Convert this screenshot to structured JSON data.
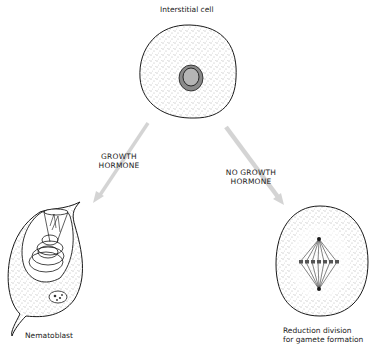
{
  "diagram": {
    "top_node": {
      "label": "Interstitial cell"
    },
    "left_branch": {
      "arrow_label_line1": "GROWTH",
      "arrow_label_line2": "HORMONE"
    },
    "right_branch": {
      "arrow_label_line1": "NO GROWTH",
      "arrow_label_line2": "HORMONE"
    },
    "left_node": {
      "label": "Nematoblast"
    },
    "right_node": {
      "label_line1": "Reduction division",
      "label_line2": "for gamete formation"
    },
    "colors": {
      "outline": "#1a1a1a",
      "arrow": "#d4d4d4",
      "nucleus_outer": "#8a8a8a",
      "nucleus_inner": "#b5b5b5",
      "stipple": "#555555"
    }
  }
}
